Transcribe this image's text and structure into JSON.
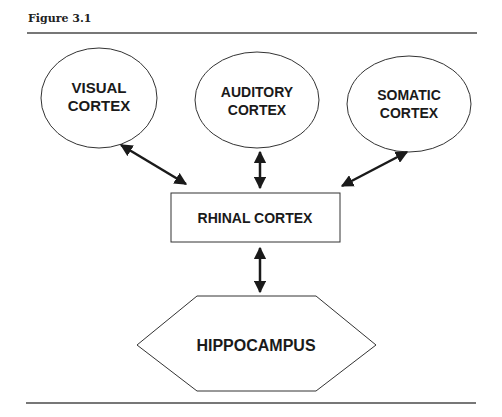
{
  "figure": {
    "title": "Figure 3.1"
  },
  "nodes": {
    "visual": {
      "line1": "VISUAL",
      "line2": "CORTEX"
    },
    "auditory": {
      "line1": "AUDITORY",
      "line2": "CORTEX"
    },
    "somatic": {
      "line1": "SOMATIC",
      "line2": "CORTEX"
    },
    "rhinal": {
      "label": "RHINAL CORTEX"
    },
    "hippocampus": {
      "label": "HIPPOCAMPUS"
    }
  },
  "edges": [
    {
      "from": "visual",
      "to": "rhinal",
      "type": "bidirectional"
    },
    {
      "from": "auditory",
      "to": "rhinal",
      "type": "bidirectional"
    },
    {
      "from": "somatic",
      "to": "rhinal",
      "type": "bidirectional"
    },
    {
      "from": "rhinal",
      "to": "hippocampus",
      "type": "bidirectional"
    }
  ],
  "colors": {
    "stroke": "#1a1a1a",
    "rule": "#777777",
    "background": "#ffffff"
  }
}
